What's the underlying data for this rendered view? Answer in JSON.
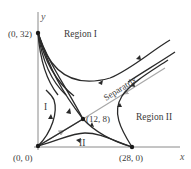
{
  "diagram": {
    "type": "phase-portrait",
    "axes": {
      "x_label": "x",
      "y_label": "y"
    },
    "points": [
      {
        "label": "(0, 32)",
        "x": 0,
        "y": 32
      },
      {
        "label": "(0, 0)",
        "x": 0,
        "y": 0
      },
      {
        "label": "(12, 8)",
        "x": 12,
        "y": 8
      },
      {
        "label": "(28, 0)",
        "x": 28,
        "y": 0
      }
    ],
    "regions": {
      "region1": "Region I",
      "region2": "Region II",
      "sub1": "I",
      "sub2": "II"
    },
    "separatrix_label": "Separatrix",
    "colors": {
      "trajectory": "#2a2a2a",
      "separatrix": "#a8a8a8",
      "axis": "#8a8a8a"
    }
  }
}
